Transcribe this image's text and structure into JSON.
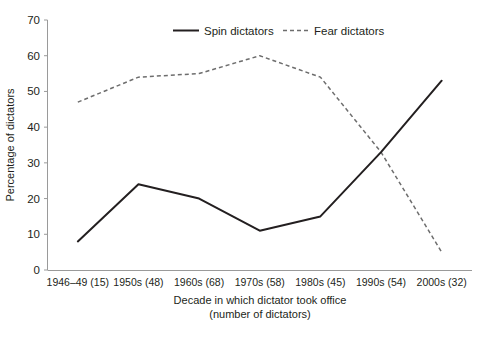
{
  "chart_data": {
    "type": "line",
    "title": "",
    "subtitle": "",
    "xlabel": "Decade in which dictator took office",
    "xlabel_line2": "(number of dictators)",
    "ylabel": "Percentage of dictators",
    "categories": [
      "1946–49 (15)",
      "1950s (48)",
      "1960s (68)",
      "1970s (58)",
      "1980s (45)",
      "1990s (54)",
      "2000s (32)"
    ],
    "series": [
      {
        "name": "Spin dictators",
        "style": "solid",
        "color": "#231f20",
        "values": [
          8,
          24,
          20,
          11,
          15,
          33,
          53
        ]
      },
      {
        "name": "Fear dictators",
        "style": "dashed",
        "color": "#6d6d6d",
        "values": [
          47,
          54,
          55,
          60,
          54,
          33,
          5
        ]
      }
    ],
    "ylim": [
      0,
      70
    ],
    "yticks": [
      0,
      10,
      20,
      30,
      40,
      50,
      60,
      70
    ],
    "ytick_labels": [
      "0",
      "10",
      "20",
      "30",
      "40",
      "50",
      "60",
      "70"
    ],
    "grid": false,
    "legend_position": "top-center"
  },
  "legend": {
    "items": [
      {
        "label": "Spin dictators"
      },
      {
        "label": "Fear dictators"
      }
    ]
  },
  "axes": {
    "y_title": "Percentage of dictators",
    "x_title_line1": "Decade in which dictator took office",
    "x_title_line2": "(number of dictators)"
  },
  "colors": {
    "spin": "#231f20",
    "fear": "#6d6d6d",
    "axis": "#9a9a9a",
    "text": "#231f20",
    "background": "#ffffff"
  }
}
